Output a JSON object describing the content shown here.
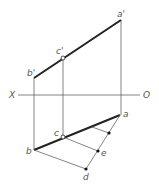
{
  "diagram": {
    "type": "orthographic-projection",
    "axis": {
      "left_label": "X",
      "right_label": "O"
    },
    "labels": {
      "a_prime": "a'",
      "b_prime": "b'",
      "c_prime": "c'",
      "a": "a",
      "b": "b",
      "c": "c",
      "d": "d",
      "e": "e"
    },
    "colors": {
      "line": "#222222",
      "thin": "#666666",
      "text": "#555555"
    }
  }
}
